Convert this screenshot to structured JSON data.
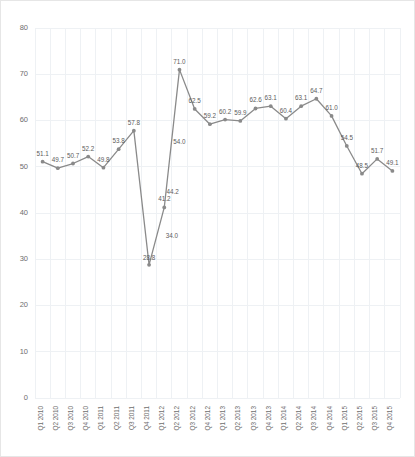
{
  "chart_data": {
    "type": "line",
    "title": "",
    "subtitle": "",
    "xlabel": "",
    "ylabel": "",
    "ylim": [
      0,
      80
    ],
    "yticks": [
      0,
      10,
      20,
      30,
      40,
      50,
      60,
      70,
      80
    ],
    "grid": true,
    "legend": false,
    "legend_position": "none",
    "line_color": "#8a8a8a",
    "marker_color": "#8a8a8a",
    "gridline_color": "#eef1f4",
    "label_color": "#5c5c5c",
    "tick_color": "#6e6e6e",
    "categories": [
      "Q1 2010",
      "Q2 2010",
      "Q3 2010",
      "Q4 2010",
      "Q1 2011",
      "Q2 2011",
      "Q3 2011",
      "Q4 2011",
      "Q1 2012",
      "Q2 2012",
      "Q3 2012",
      "Q4 2012",
      "Q1 2013",
      "Q2 2013",
      "Q3 2013",
      "Q4 2013",
      "Q1 2014",
      "Q2 2014",
      "Q3 2014",
      "Q4 2014",
      "Q1 2015",
      "Q2 2015",
      "Q3 2015",
      "Q4 2015"
    ],
    "values": [
      51.1,
      49.7,
      50.7,
      52.2,
      49.8,
      53.8,
      57.8,
      28.8,
      41.2,
      71.0,
      62.5,
      59.2,
      60.2,
      59.9,
      62.6,
      63.1,
      60.4,
      63.1,
      64.7,
      61.0,
      54.5,
      48.5,
      51.7,
      49.1
    ],
    "point_labels": [
      "51.1",
      "49.7",
      "50.7",
      "52.2",
      "49.8",
      "53.8",
      "57.8",
      "28.8",
      "41.2",
      "71.0",
      "62.5",
      "59.2",
      "60.2",
      "59.9",
      "62.6",
      "63.1",
      "60.4",
      "63.1",
      "64.7",
      "61.0",
      "54.5",
      "48.5",
      "51.7",
      "49.1"
    ],
    "annotations": [
      {
        "text": "44.2",
        "x_index": 8.55,
        "value": 44.2
      },
      {
        "text": "54.0",
        "x_index": 9.0,
        "value": 55.0
      },
      {
        "text": "34.0",
        "x_index": 8.5,
        "value": 34.5
      }
    ]
  }
}
